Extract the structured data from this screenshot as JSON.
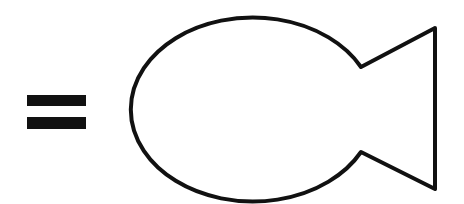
{
  "diagram": {
    "background": "#ffffff",
    "stroke_color": "#111111",
    "elements": [
      {
        "type": "equals-sign",
        "bars": [
          {
            "x": 27,
            "y": 95,
            "width": 59,
            "height": 11
          },
          {
            "x": 27,
            "y": 117,
            "width": 59,
            "height": 12
          }
        ]
      },
      {
        "type": "fish-outline",
        "body": {
          "left_x": 122,
          "top_y": 17,
          "bottom_y": 200
        },
        "notch_top": [
          361,
          67
        ],
        "notch_bottom": [
          361,
          152
        ],
        "tail_top": [
          435,
          28
        ],
        "tail_bottom": [
          435,
          189
        ],
        "stroke_width": 4
      }
    ]
  }
}
